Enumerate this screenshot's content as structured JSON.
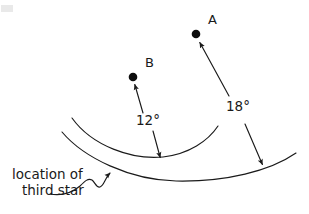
{
  "figure": {
    "background_color": "#ffffff",
    "ink_color": "#1a1a1a",
    "width": 309,
    "height": 214,
    "stars": [
      {
        "id": "star-a",
        "label": "A",
        "dot_x": 196,
        "dot_y": 34,
        "dot_radius": 4.3,
        "label_x": 208,
        "label_y": 24
      },
      {
        "id": "star-b",
        "label": "B",
        "dot_x": 133,
        "dot_y": 77,
        "dot_radius": 4.3,
        "label_x": 145,
        "label_y": 67
      }
    ],
    "angles": [
      {
        "id": "angle-12",
        "label": "12°",
        "value": 12,
        "unit": "degrees",
        "label_x": 148,
        "label_y": 125,
        "from": "third star",
        "to": "star B"
      },
      {
        "id": "angle-18",
        "label": "18°",
        "value": 18,
        "unit": "degrees",
        "label_x": 238,
        "label_y": 111,
        "from": "third star",
        "to": "star A"
      }
    ],
    "caption": {
      "line1": "location of",
      "line2": "third star",
      "x": 12,
      "line1_y": 179,
      "line2_y": 195,
      "points_to_x": 110,
      "points_to_y": 160
    },
    "curves": [
      {
        "id": "upper-arc",
        "description": "small concave-up arc through the third star location",
        "path": "M 72 118 C 92 146, 132 160, 163 157 C 189 154, 208 141, 218 126"
      },
      {
        "id": "lower-arc",
        "description": "large concave-up arc through the third star location",
        "path": "M 62 132 C 84 158, 130 180, 176 181 C 226 182, 270 171, 296 153"
      }
    ],
    "rays": [
      {
        "id": "ray-to-b",
        "description": "double-headed arrow from arc up to star B marking 12 degrees",
        "from_x": 160,
        "from_y": 160,
        "to_x": 134,
        "to_y": 83
      },
      {
        "id": "ray-to-a",
        "description": "double-headed arrow from arc up to star A marking 18 degrees",
        "from_x": 263,
        "from_y": 167,
        "to_x": 199,
        "to_y": 41
      }
    ]
  }
}
